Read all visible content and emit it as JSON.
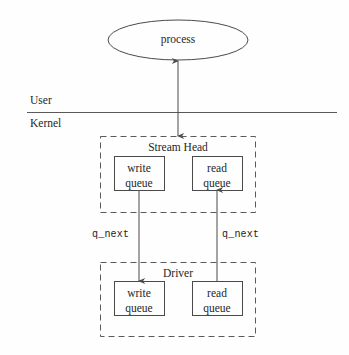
{
  "diagram": {
    "title_text": "STREAMS stream head and driver queue diagram",
    "process_node": {
      "label": "process",
      "shape": "ellipse",
      "cx": 178,
      "cy": 40,
      "rx": 70,
      "ry": 20
    },
    "boundary": {
      "upper_label": "User",
      "lower_label": "Kernel",
      "line_y": 112,
      "line_x_start": 27,
      "line_x_end": 337
    },
    "groups": [
      {
        "name": "stream-head",
        "label": "Stream Head",
        "x": 100,
        "y": 136,
        "width": 156,
        "height": 77,
        "queues": [
          {
            "name": "write-queue",
            "line1": "write",
            "line2": "queue",
            "x": 114,
            "y": 156,
            "width": 50,
            "height": 34
          },
          {
            "name": "read-queue",
            "line1": "read",
            "line2": "queue",
            "x": 192,
            "y": 156,
            "width": 50,
            "height": 34
          }
        ]
      },
      {
        "name": "driver",
        "label": "Driver",
        "x": 100,
        "y": 262,
        "width": 156,
        "height": 75,
        "queues": [
          {
            "name": "write-queue",
            "line1": "write",
            "line2": "queue",
            "x": 114,
            "y": 281,
            "width": 50,
            "height": 34
          },
          {
            "name": "read-queue",
            "line1": "read",
            "line2": "queue",
            "x": 192,
            "y": 281,
            "width": 50,
            "height": 34
          }
        ]
      }
    ],
    "connectors": [
      {
        "name": "process-streamhead-arrow",
        "kind": "bidirectional-vertical",
        "x": 178,
        "y_top": 60,
        "y_bottom": 137,
        "label": ""
      },
      {
        "name": "write-qnext-arrow",
        "kind": "downward-vertical",
        "x": 139,
        "y_top": 190,
        "y_bottom": 281,
        "label": "q_next",
        "label_x": 92,
        "label_y": 235
      },
      {
        "name": "read-qnext-arrow",
        "kind": "upward-vertical",
        "x": 217,
        "y_top": 190,
        "y_bottom": 281,
        "label": "q_next",
        "label_x": 222,
        "label_y": 235
      }
    ],
    "colors": {
      "stroke": "#4a4a4a",
      "text": "#262626",
      "background": "#fefefe",
      "dashed_stroke": "#5a5a5a"
    }
  }
}
